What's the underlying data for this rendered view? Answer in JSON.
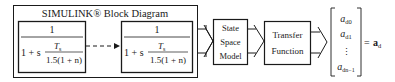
{
  "diagram": {
    "simulink_group": {
      "title": "SIMULINK® Block Diagram",
      "blocks": [
        {
          "numerator": "1",
          "denom_prefix": "1 + s",
          "frac_num": "T",
          "frac_num_sub": "s",
          "frac_den": "1.5(1 + n)"
        },
        {
          "numerator": "1",
          "denom_prefix": "1 + s",
          "frac_num": "T",
          "frac_num_sub": "s",
          "frac_den": "1.5(1 + n)"
        }
      ],
      "connector": "dashed-arrow"
    },
    "state_space": {
      "lines": [
        "State",
        "Space",
        "Model"
      ]
    },
    "transfer_function": {
      "lines": [
        "Transfer",
        "Function"
      ]
    },
    "output_vector": {
      "entries": [
        {
          "base": "a",
          "sub": "d0"
        },
        {
          "base": "a",
          "sub": "d1"
        },
        {
          "base": "⋮",
          "sub": ""
        },
        {
          "base": "a",
          "sub": "dn−1"
        }
      ],
      "equals": "=",
      "result_base": "a",
      "result_sub": "d"
    }
  }
}
